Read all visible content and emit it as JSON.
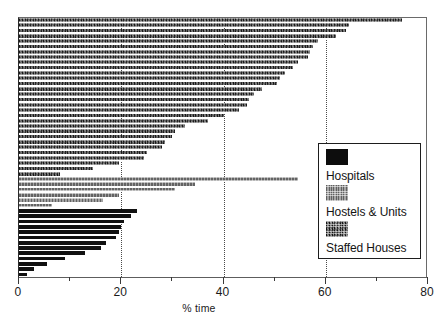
{
  "chart_data": {
    "type": "bar",
    "orientation": "horizontal",
    "title": "",
    "xlabel": "% time",
    "ylabel": "",
    "xlim": [
      0,
      80
    ],
    "ylim": [
      0,
      47
    ],
    "grid": "vertical dotted gridlines at 20, 40, 60",
    "xticks_major": [
      0,
      20,
      40,
      60,
      80
    ],
    "xticks_minor": [
      10,
      30,
      50,
      70
    ],
    "xtick_labels": [
      "0",
      "20",
      "40",
      "60",
      "80"
    ],
    "legend_position": "lower right",
    "series": [
      {
        "name": "Staffed Houses",
        "color": "#3a3a3a",
        "pattern": "dark-speckled-dither",
        "values": [
          75.0,
          64.5,
          64.0,
          62.0,
          58.5,
          57.5,
          57.0,
          56.5,
          54.5,
          53.5,
          52.0,
          51.0,
          50.5,
          47.5,
          46.0,
          45.0,
          44.5,
          43.0,
          40.0,
          37.0,
          32.5,
          30.5,
          30.0,
          28.5,
          28.0,
          25.0,
          24.5,
          19.5,
          14.5,
          8.0
        ]
      },
      {
        "name": "Hostels & Units",
        "color": "#8e8e8e",
        "pattern": "medium-gray-dither",
        "values": [
          54.5,
          34.5,
          30.5,
          19.5,
          16.5,
          6.5
        ]
      },
      {
        "name": "Hospitals",
        "color": "#111111",
        "pattern": "solid-black",
        "values": [
          23.0,
          22.0,
          20.5,
          20.0,
          19.5,
          19.0,
          17.0,
          16.0,
          13.0,
          9.0,
          5.5,
          3.0,
          1.5
        ]
      }
    ]
  },
  "axis": {
    "x_label": "% time",
    "tick_0": "0",
    "tick_20": "20",
    "tick_40": "40",
    "tick_60": "60",
    "tick_80": "80"
  },
  "legend": {
    "entries": [
      {
        "label": "Hospitals",
        "swatch": "hospitals"
      },
      {
        "label": "Hostels & Units",
        "swatch": "hostels"
      },
      {
        "label": "Staffed Houses",
        "swatch": "staffed"
      }
    ]
  }
}
